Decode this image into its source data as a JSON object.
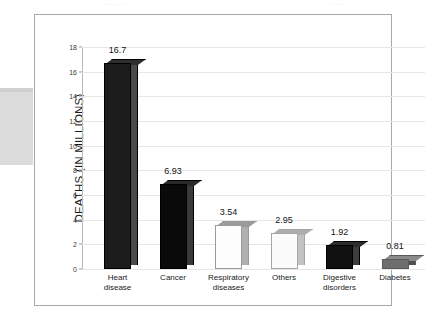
{
  "artifacts": {
    "top_ghost_left": "........",
    "top_ghost_right": "....."
  },
  "chart_data": {
    "type": "bar",
    "title": "",
    "xlabel": "",
    "ylabel": "DEATHS (IN MILLIONS)",
    "ylim": [
      0,
      18
    ],
    "grid": true,
    "legend": "none",
    "y_ticks": [
      "0",
      "2",
      "4",
      "6",
      "8",
      "10",
      "12",
      "14",
      "16",
      "18"
    ],
    "y_tick_values": [
      0,
      2,
      4,
      6,
      8,
      10,
      12,
      14,
      16,
      18
    ],
    "categories": [
      "Heart\ndisease",
      "Cancer",
      "Respiratory\ndiseases",
      "Others",
      "Digestive\ndisorders",
      "Diabetes"
    ],
    "values": [
      16.7,
      6.93,
      3.54,
      2.95,
      1.92,
      0.81
    ],
    "value_labels": [
      "16.7",
      "6.93",
      "3.54",
      "2.95",
      "1.92",
      "0.81"
    ],
    "bar_colors": [
      "#1c1c1c",
      "#0a0a0a",
      "#fdfdfd",
      "#fbfbfb",
      "#111111",
      "#6e6e6e"
    ],
    "bar_side_colors": [
      "#4a4a4a",
      "#3a3a3a",
      "#b0b0b0",
      "#c2c2c2",
      "#3d3d3d",
      "#4f4f4f"
    ],
    "bar_top_colors": [
      "#2e2e2e",
      "#2a2a2a",
      "#9a9a9a",
      "#aeaeae",
      "#2c2c2c",
      "#8a8a8a"
    ],
    "bar_edge_colors": [
      "#000000",
      "#000000",
      "#9b9b9b",
      "#a5a5a5",
      "#000000",
      "#5a5a5a"
    ]
  }
}
